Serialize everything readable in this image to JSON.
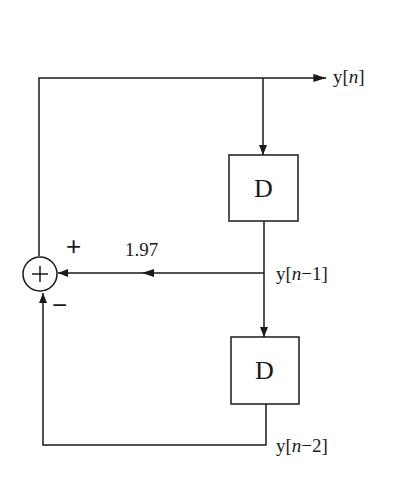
{
  "diagram": {
    "type": "block-diagram",
    "colors": {
      "stroke": "#1a1a1a",
      "background": "#ffffff"
    },
    "summing_junction": {
      "symbol": "+",
      "input_signs": {
        "top": "+",
        "bottom": "−"
      }
    },
    "delay_blocks": [
      {
        "id": "delay1",
        "label": "D"
      },
      {
        "id": "delay2",
        "label": "D"
      }
    ],
    "signals": {
      "output": {
        "prefix": "y[",
        "index": "n",
        "suffix": "]"
      },
      "delayed1": {
        "prefix": "y[",
        "index": "n",
        "suffix": "−1]"
      },
      "delayed2": {
        "prefix": "y[",
        "index": "n",
        "suffix": "−2]"
      }
    },
    "gain": {
      "value": "1.97"
    }
  }
}
